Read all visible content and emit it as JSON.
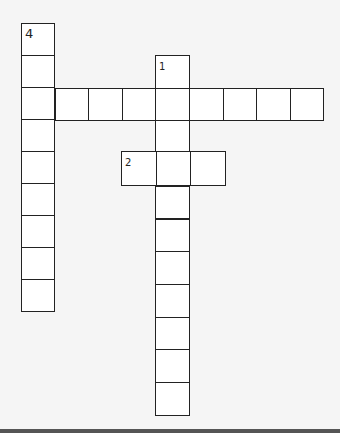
{
  "puzzle": {
    "type": "crossword",
    "words": [
      {
        "number": "1",
        "direction": "down",
        "length": 11,
        "x": 155,
        "y": 55,
        "cell_w": 34,
        "cell_h": 32.7,
        "label_size": "small"
      },
      {
        "number": "2",
        "direction": "across",
        "length": 3,
        "x": 121,
        "y": 151,
        "cell_w": 34.7,
        "cell_h": 34,
        "label_size": "small"
      },
      {
        "number": "3",
        "direction": "across",
        "length": 9,
        "x": 21,
        "y": 88,
        "cell_w": 33.6,
        "cell_h": 32,
        "label_size": "big"
      },
      {
        "number": "4",
        "direction": "down",
        "length": 9,
        "x": 21,
        "y": 23,
        "cell_w": 33,
        "cell_h": 32,
        "label_size": "big"
      }
    ]
  },
  "colors": {
    "background": "#f5f5f5",
    "cell": "#ffffff",
    "border": "#222222"
  }
}
